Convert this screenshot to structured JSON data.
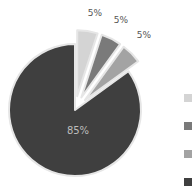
{
  "chart_data": {
    "type": "pie",
    "title": "",
    "exploded": true,
    "categories": [
      "Slice 1",
      "Slice 2",
      "Slice 3",
      "Slice 4"
    ],
    "values": [
      5,
      5,
      5,
      85
    ],
    "labels": [
      "5%",
      "5%",
      "5%",
      "85%"
    ],
    "colors": [
      "#d4d4d4",
      "#7a7a7a",
      "#a3a3a3",
      "#3f3f3f"
    ],
    "start_angle_deg": 0,
    "direction": "clockwise",
    "legend": {
      "position": "right",
      "entries_visible": [
        "",
        "",
        "",
        ""
      ],
      "note": "legend text cut off at right edge; only color swatches visible"
    }
  },
  "labels": {
    "s1": "5%",
    "s2": "5%",
    "s3": "5%",
    "s4": "85%"
  }
}
